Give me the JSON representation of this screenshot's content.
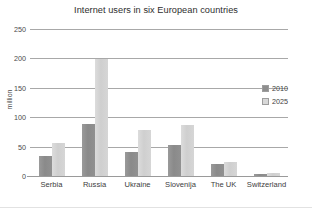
{
  "chart_data": {
    "type": "bar",
    "title": "Internet users in six European countries",
    "xlabel": "",
    "ylabel": "million",
    "ylim": [
      0,
      250
    ],
    "yticks": [
      0,
      50,
      100,
      150,
      200,
      250
    ],
    "grid": true,
    "legend_position": "right",
    "categories": [
      "Serbia",
      "Russia",
      "Ukraine",
      "Slovenija",
      "The UK",
      "Switzerland"
    ],
    "series": [
      {
        "name": "2010",
        "color": "#8e8e8e",
        "values": [
          36,
          90,
          43,
          54,
          22,
          5
        ]
      },
      {
        "name": "2025",
        "color": "#d2d2d2",
        "values": [
          57,
          200,
          80,
          89,
          26,
          7
        ]
      }
    ]
  },
  "legend": {
    "items": [
      {
        "label": "2010"
      },
      {
        "label": "2025"
      }
    ]
  }
}
